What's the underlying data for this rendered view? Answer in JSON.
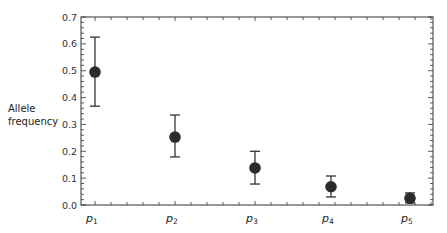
{
  "chart_data": {
    "type": "scatter",
    "title": "",
    "xlabel": "",
    "ylabel": "Allele frequency",
    "ylabel_lines": [
      "Allele",
      "frequency"
    ],
    "categories": [
      {
        "base": "p",
        "sub": "1"
      },
      {
        "base": "p",
        "sub": "2"
      },
      {
        "base": "p",
        "sub": "3"
      },
      {
        "base": "p",
        "sub": "4"
      },
      {
        "base": "p",
        "sub": "5"
      }
    ],
    "category_labels": [
      "p1",
      "p2",
      "p3",
      "p4",
      "p5"
    ],
    "values": [
      0.495,
      0.253,
      0.138,
      0.068,
      0.025
    ],
    "error_upper": [
      0.625,
      0.335,
      0.2,
      0.108,
      0.045
    ],
    "error_lower": [
      0.368,
      0.179,
      0.078,
      0.03,
      0.008
    ],
    "ylim": [
      0.0,
      0.7
    ],
    "yticks": [
      0.0,
      0.1,
      0.2,
      0.3,
      0.4,
      0.5,
      0.6,
      0.7
    ],
    "ytick_labels": [
      "0.0",
      "0.1",
      "0.2",
      "0.3",
      "0.4",
      "0.5",
      "0.6",
      "0.7"
    ],
    "grid": false,
    "legend": null,
    "marker_color": "#2b2b2b",
    "axis_color": "#333333"
  }
}
